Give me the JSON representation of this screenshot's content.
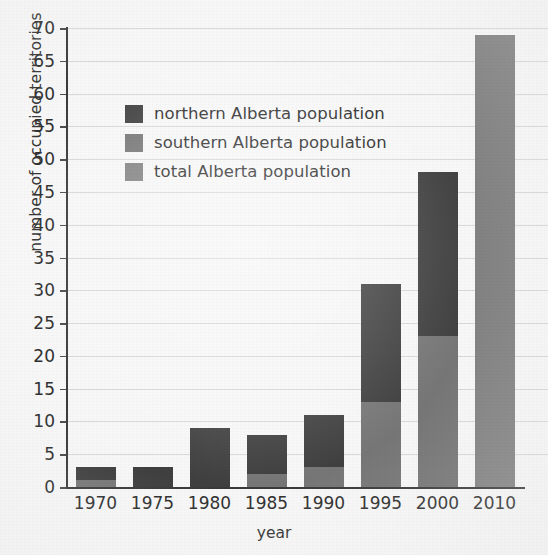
{
  "chart_data": {
    "type": "bar",
    "title": "",
    "subtitle": "",
    "xlabel": "year",
    "ylabel": "number of occupied territories",
    "categories": [
      "1970",
      "1975",
      "1980",
      "1985",
      "1990",
      "1995",
      "2000",
      "2010"
    ],
    "series": [
      {
        "name": "southern Alberta population",
        "color": "#767676",
        "values": [
          1,
          0,
          0,
          2,
          3,
          13,
          23,
          null
        ]
      },
      {
        "name": "northern Alberta population",
        "color": "#3f3f3f",
        "values": [
          2,
          3,
          9,
          6,
          8,
          18,
          25,
          null
        ]
      },
      {
        "name": "total Alberta population",
        "color": "#828282",
        "values": [
          null,
          null,
          null,
          null,
          null,
          null,
          null,
          69
        ]
      }
    ],
    "stacked": true,
    "stack_totals": [
      3,
      3,
      9,
      8,
      11,
      31,
      48,
      69
    ],
    "ylim": [
      0,
      70
    ],
    "ytick_step": 5,
    "yticks": [
      0,
      5,
      10,
      15,
      20,
      25,
      30,
      35,
      40,
      45,
      50,
      55,
      60,
      65,
      70
    ],
    "ytick_labels": [
      "0",
      "5",
      "10",
      "15",
      "20",
      "25",
      "30",
      "35",
      "40",
      "45",
      "50",
      "55",
      "60",
      "65",
      "70"
    ],
    "grid": true,
    "grid_axis": "y",
    "grid_color": "#d8d8d8",
    "legend_position": "upper left inside",
    "background_color": "#f7f7f7",
    "axis_color": "#3a3a3a",
    "annotations": []
  },
  "legend": {
    "items": [
      {
        "label": "northern Alberta population",
        "color": "#3f3f3f"
      },
      {
        "label": "southern Alberta population",
        "color": "#767676"
      },
      {
        "label": "total Alberta population",
        "color": "#828282"
      }
    ]
  }
}
